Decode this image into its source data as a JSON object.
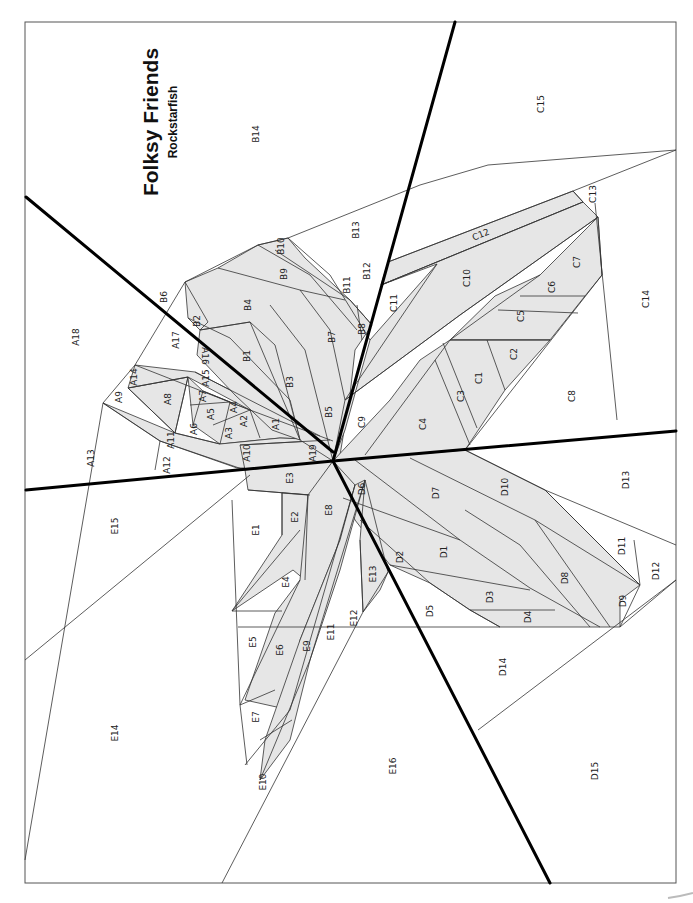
{
  "pattern": {
    "title": "Folksy Friends",
    "subtitle": "Rockstarfish",
    "colors": {
      "shaded_fill": "#e6e6e6",
      "section_line": "#000000",
      "seam_line": "#333333",
      "background": "#ffffff"
    },
    "sections": {
      "A": {
        "labels": [
          "A1",
          "A2",
          "A3",
          "A4",
          "A5",
          "A6",
          "A7",
          "A8",
          "A9",
          "A10",
          "A11",
          "A12",
          "A13",
          "A14",
          "A15",
          "A16",
          "A17",
          "A18",
          "A19"
        ]
      },
      "B": {
        "labels": [
          "B1",
          "B2",
          "B3",
          "B4",
          "B5",
          "B6",
          "B7",
          "B8",
          "B9",
          "B10",
          "B11",
          "B12",
          "B13",
          "B14"
        ]
      },
      "C": {
        "labels": [
          "C1",
          "C2",
          "C3",
          "C4",
          "C5",
          "C6",
          "C7",
          "C8",
          "C9",
          "C10",
          "C11",
          "C12",
          "C13",
          "C14",
          "C15"
        ]
      },
      "D": {
        "labels": [
          "D1",
          "D2",
          "D3",
          "D4",
          "D5",
          "D6",
          "D7",
          "D8",
          "D9",
          "D10",
          "D11",
          "D12",
          "D13",
          "D14",
          "D15"
        ]
      },
      "E": {
        "labels": [
          "E1",
          "E2",
          "E3",
          "E4",
          "E5",
          "E6",
          "E7",
          "E8",
          "E9",
          "E10",
          "E11",
          "E12",
          "E13",
          "E14",
          "E15",
          "E16"
        ]
      }
    },
    "labels": {
      "A1": "A1",
      "A2": "A2",
      "A3": "A3",
      "A4": "A4",
      "A5": "A5",
      "A6": "A6",
      "A7": "A7",
      "A8": "A8",
      "A9": "A9",
      "A10": "A10",
      "A11": "A11",
      "A12": "A12",
      "A13": "A13",
      "A14": "A14",
      "A15": "A15",
      "A16": "A16",
      "A17": "A17",
      "A18": "A18",
      "A19": "A19",
      "B1": "B1",
      "B2": "B2",
      "B3": "B3",
      "B4": "B4",
      "B5": "B5",
      "B6": "B6",
      "B7": "B7",
      "B8": "B8",
      "B9": "B9",
      "B10": "B10",
      "B11": "B11",
      "B12": "B12",
      "B13": "B13",
      "B14": "B14",
      "C1": "C1",
      "C2": "C2",
      "C3": "C3",
      "C4": "C4",
      "C5": "C5",
      "C6": "C6",
      "C7": "C7",
      "C8": "C8",
      "C9": "C9",
      "C10": "C10",
      "C11": "C11",
      "C12": "C12",
      "C13": "C13",
      "C14": "C14",
      "C15": "C15",
      "D1": "D1",
      "D2": "D2",
      "D3": "D3",
      "D4": "D4",
      "D5": "D5",
      "D6": "D6",
      "D7": "D7",
      "D8": "D8",
      "D9": "D9",
      "D10": "D10",
      "D11": "D11",
      "D12": "D12",
      "D13": "D13",
      "D14": "D14",
      "D15": "D15",
      "E1": "E1",
      "E2": "E2",
      "E3": "E3",
      "E4": "E4",
      "E5": "E5",
      "E6": "E6",
      "E7": "E7",
      "E8": "E8",
      "E9": "E9",
      "E10": "E10",
      "E11": "E11",
      "E12": "E12",
      "E13": "E13",
      "E14": "E14",
      "E15": "E15",
      "E16": "E16"
    }
  }
}
